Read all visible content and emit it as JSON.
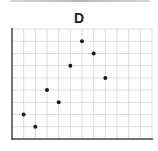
{
  "chart_data": {
    "type": "scatter",
    "title": "D",
    "xlabel": "",
    "ylabel": "",
    "grid": true,
    "xlim": [
      0,
      12
    ],
    "ylim": [
      0,
      9
    ],
    "points": [
      {
        "x": 1,
        "y": 2
      },
      {
        "x": 2,
        "y": 1
      },
      {
        "x": 3,
        "y": 4
      },
      {
        "x": 4,
        "y": 3
      },
      {
        "x": 5,
        "y": 6
      },
      {
        "x": 6,
        "y": 8
      },
      {
        "x": 7,
        "y": 7
      },
      {
        "x": 8,
        "y": 5
      }
    ],
    "x": [
      1,
      2,
      3,
      4,
      5,
      6,
      7,
      8
    ],
    "values": [
      2,
      1,
      4,
      3,
      6,
      8,
      7,
      5
    ],
    "legend": []
  },
  "colors": {
    "grid": "#d4d4d4",
    "axis": "#444444",
    "point": "#1a1a1a",
    "title": "#222222"
  }
}
